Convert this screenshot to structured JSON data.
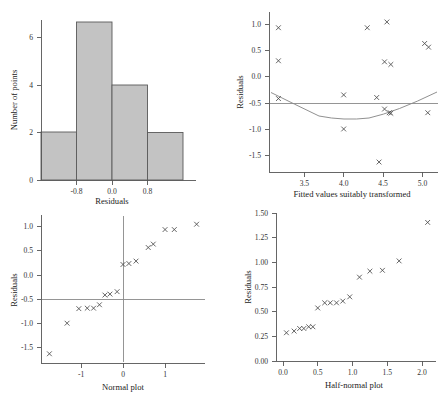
{
  "figure": {
    "panel_count": 4,
    "marker_glyph": "x"
  },
  "chart_data": [
    {
      "id": "histogram",
      "type": "bar",
      "title": "",
      "xlabel": "Residuals",
      "ylabel": "Number of points",
      "xlim": [
        -1.2,
        1.2
      ],
      "ylim": [
        0,
        7.6
      ],
      "xticks": [
        -0.8,
        0.0,
        0.8
      ],
      "xtick_labels": [
        "-0.8",
        "0.0",
        "0.8"
      ],
      "yticks": [
        0,
        2,
        4,
        6
      ],
      "ytick_labels": [
        "0",
        "2",
        "4",
        "6"
      ],
      "grid": false,
      "legend": "none",
      "bin_edges": [
        -1.2,
        -0.6,
        0.0,
        0.6,
        1.2
      ],
      "categories": [
        "-1.2 to -0.6",
        "-0.6 to 0.0",
        "0.0 to 0.6",
        "0.6 to 1.2"
      ],
      "values": [
        2,
        7,
        5,
        3
      ],
      "bar_fill": "#c3c3c3",
      "bar_stroke": "#5a5a5a"
    },
    {
      "id": "residuals-vs-fitted",
      "type": "scatter",
      "title": "",
      "xlabel": "Fitted values suitably transformed",
      "ylabel": "Residuals",
      "xlim": [
        3.05,
        5.2
      ],
      "ylim": [
        -1.75,
        1.3
      ],
      "xticks": [
        3.5,
        4.0,
        4.5,
        5.0
      ],
      "xtick_labels": [
        "3.5",
        "4.0",
        "4.5",
        "5.0"
      ],
      "yticks": [
        -1.5,
        -1.0,
        -0.5,
        0.0,
        0.5,
        1.0
      ],
      "ytick_labels": [
        "-1.5",
        "-1.0",
        "-0.5",
        "0.0",
        "0.5",
        "1.0"
      ],
      "grid": false,
      "legend": "none",
      "points": [
        {
          "x": 3.17,
          "y": 1.0
        },
        {
          "x": 3.17,
          "y": 0.37
        },
        {
          "x": 3.17,
          "y": -0.35
        },
        {
          "x": 4.0,
          "y": -0.28
        },
        {
          "x": 4.0,
          "y": -0.93
        },
        {
          "x": 4.3,
          "y": 1.0
        },
        {
          "x": 4.42,
          "y": -0.33
        },
        {
          "x": 4.45,
          "y": -1.56
        },
        {
          "x": 4.55,
          "y": 1.11
        },
        {
          "x": 4.52,
          "y": 0.35
        },
        {
          "x": 4.6,
          "y": 0.3
        },
        {
          "x": 4.52,
          "y": -0.55
        },
        {
          "x": 4.58,
          "y": -0.62
        },
        {
          "x": 4.6,
          "y": -0.63
        },
        {
          "x": 5.03,
          "y": 0.7
        },
        {
          "x": 5.08,
          "y": 0.63
        },
        {
          "x": 5.07,
          "y": -0.62
        }
      ],
      "reference_line": {
        "type": "horizontal",
        "y": 0.0,
        "color": "#8a8a8a"
      },
      "smooth_curve": {
        "description": "quadratic lowess-style smoother",
        "color": "#8a8a8a",
        "points": [
          {
            "x": 3.07,
            "y": 0.2
          },
          {
            "x": 3.3,
            "y": 0.02
          },
          {
            "x": 3.55,
            "y": -0.13
          },
          {
            "x": 3.8,
            "y": -0.22
          },
          {
            "x": 4.05,
            "y": -0.255
          },
          {
            "x": 4.3,
            "y": -0.26
          },
          {
            "x": 4.55,
            "y": -0.23
          },
          {
            "x": 4.75,
            "y": -0.14
          },
          {
            "x": 4.95,
            "y": 0.0
          },
          {
            "x": 5.15,
            "y": 0.2
          }
        ]
      }
    },
    {
      "id": "normal-plot",
      "type": "scatter",
      "title": "",
      "xlabel": "Normal plot",
      "ylabel": "Residuals",
      "xlim": [
        -1.95,
        1.95
      ],
      "ylim": [
        -1.75,
        1.3
      ],
      "xticks": [
        -1,
        0,
        1
      ],
      "xtick_labels": [
        "-1",
        "0",
        "1"
      ],
      "yticks": [
        -1.5,
        -1.0,
        -0.5,
        0.0,
        0.5,
        1.0
      ],
      "ytick_labels": [
        "-1.5",
        "-1.0",
        "-0.5",
        "0.0",
        "0.5",
        "1.0"
      ],
      "grid": false,
      "legend": "none",
      "points": [
        {
          "x": -1.75,
          "y": -1.56
        },
        {
          "x": -1.33,
          "y": -0.93
        },
        {
          "x": -1.05,
          "y": -0.63
        },
        {
          "x": -0.85,
          "y": -0.62
        },
        {
          "x": -0.7,
          "y": -0.62
        },
        {
          "x": -0.56,
          "y": -0.55
        },
        {
          "x": -0.43,
          "y": -0.35
        },
        {
          "x": -0.31,
          "y": -0.33
        },
        {
          "x": -0.14,
          "y": -0.28
        },
        {
          "x": 0.0,
          "y": 0.28
        },
        {
          "x": 0.14,
          "y": 0.3
        },
        {
          "x": 0.31,
          "y": 0.35
        },
        {
          "x": 0.6,
          "y": 0.63
        },
        {
          "x": 0.72,
          "y": 0.7
        },
        {
          "x": 1.0,
          "y": 1.0
        },
        {
          "x": 1.22,
          "y": 1.0
        },
        {
          "x": 1.75,
          "y": 1.11
        }
      ],
      "reference_lines": [
        {
          "type": "horizontal",
          "y": 0.0,
          "color": "#8a8a8a"
        },
        {
          "type": "vertical",
          "x": 0.0,
          "color": "#8a8a8a"
        }
      ]
    },
    {
      "id": "half-normal-plot",
      "type": "scatter",
      "title": "",
      "xlabel": "Half-normal plot",
      "ylabel": "Residuals",
      "xlim": [
        -0.1,
        2.2
      ],
      "ylim": [
        -0.05,
        1.68
      ],
      "xticks": [
        0.0,
        0.5,
        1.0,
        1.5,
        2.0
      ],
      "xtick_labels": [
        "0.0",
        "0.5",
        "1.0",
        "1.5",
        "2.0"
      ],
      "yticks": [
        0.0,
        0.25,
        0.5,
        0.75,
        1.0,
        1.25,
        1.5
      ],
      "ytick_labels": [
        "0.00",
        "0.25",
        "0.50",
        "0.75",
        "1.00",
        "1.25",
        "1.50"
      ],
      "grid": false,
      "legend": "none",
      "points": [
        {
          "x": 0.05,
          "y": 0.28
        },
        {
          "x": 0.16,
          "y": 0.3
        },
        {
          "x": 0.24,
          "y": 0.33
        },
        {
          "x": 0.3,
          "y": 0.33
        },
        {
          "x": 0.37,
          "y": 0.35
        },
        {
          "x": 0.43,
          "y": 0.35
        },
        {
          "x": 0.5,
          "y": 0.57
        },
        {
          "x": 0.6,
          "y": 0.63
        },
        {
          "x": 0.68,
          "y": 0.63
        },
        {
          "x": 0.77,
          "y": 0.63
        },
        {
          "x": 0.86,
          "y": 0.65
        },
        {
          "x": 0.96,
          "y": 0.7
        },
        {
          "x": 1.1,
          "y": 0.93
        },
        {
          "x": 1.25,
          "y": 1.0
        },
        {
          "x": 1.43,
          "y": 1.01
        },
        {
          "x": 1.67,
          "y": 1.12
        },
        {
          "x": 2.08,
          "y": 1.57
        }
      ]
    }
  ]
}
